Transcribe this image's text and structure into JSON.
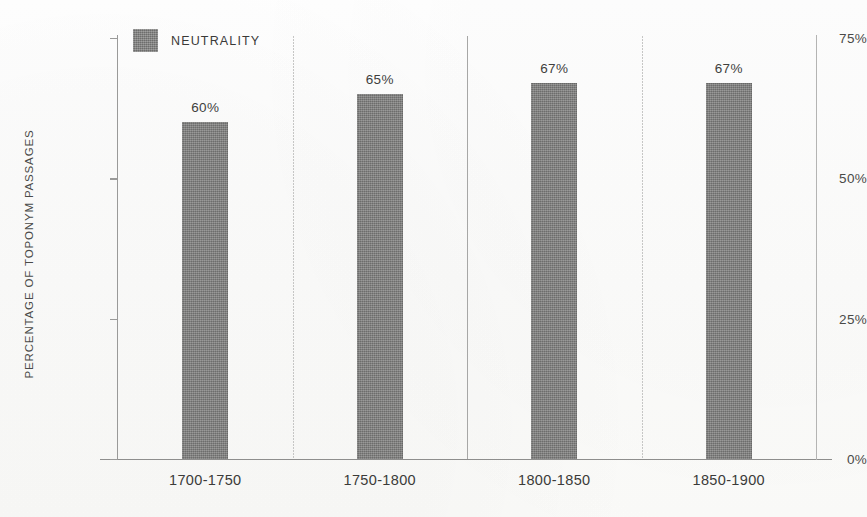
{
  "chart_data": {
    "type": "bar",
    "title": "",
    "subtitle": "",
    "xlabel": "",
    "ylabel": "PERCENTAGE OF TOPONYM PASSAGES",
    "categories": [
      "1700-1750",
      "1750-1800",
      "1800-1850",
      "1850-1900"
    ],
    "series": [
      {
        "name": "NEUTRALITY",
        "values": [
          60,
          65,
          67,
          67
        ],
        "value_labels": [
          "60%",
          "65%",
          "67%",
          "67%"
        ],
        "color": "#7c7c7b"
      }
    ],
    "ylim": [
      0,
      75
    ],
    "ytick_values": [
      75,
      50,
      25,
      0
    ],
    "ytick_labels": [
      "75%",
      "50%",
      "25%",
      "0%"
    ],
    "grid": false,
    "category_separators": true,
    "legend": {
      "position": "top-left-inside",
      "entries": [
        {
          "label": "NEUTRALITY",
          "color": "#7c7c7b"
        }
      ]
    },
    "axis_color": "#9a9a99",
    "separator_color": "#c3c3c2",
    "text_color": "#3f3f3d",
    "background": "#fdfdfc"
  }
}
